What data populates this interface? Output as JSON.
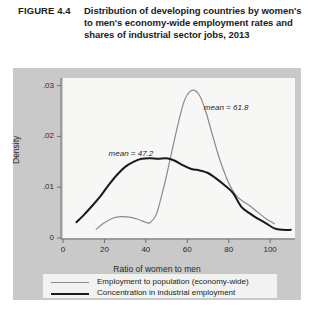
{
  "caption": {
    "label": "FIGURE 4.4",
    "text": "Distribution of developing countries by women's to men's economy-wide employment rates and shares of industrial sector jobs, 2013"
  },
  "colors": {
    "frame": "#c9c9c9",
    "panel": "#f7f7f5",
    "series_gray": "#8a8a8a",
    "series_black": "#1a1a1a",
    "axis": "#6f6f6f",
    "text": "#1b1b1b"
  },
  "chart_data": {
    "type": "line",
    "title": "Distribution of developing countries by women's to men's economy-wide employment rates and shares of industrial sector jobs, 2013",
    "xlabel": "Ratio of women to men",
    "ylabel": "Density",
    "xlim": [
      0,
      112
    ],
    "ylim": [
      0,
      0.0315
    ],
    "xticks": [
      "0",
      "20",
      "40",
      "60",
      "80",
      "100"
    ],
    "xtick_values": [
      0,
      20,
      40,
      60,
      80,
      100
    ],
    "yticks": [
      "0",
      ".01",
      ".02",
      ".03"
    ],
    "ytick_values": [
      0,
      0.01,
      0.02,
      0.03
    ],
    "grid": false,
    "legend_position": "bottom",
    "annotations": [
      {
        "text": "mean = 61.8",
        "x": 68,
        "y": 0.0255
      },
      {
        "text": "mean = 47.2",
        "x": 22,
        "y": 0.0165
      }
    ],
    "series": [
      {
        "name": "Employment to population (economy-wide)",
        "color": "#8a8a8a",
        "width": 1.2,
        "mean": 61.8,
        "x": [
          16,
          20,
          24,
          28,
          32,
          36,
          40,
          42,
          45,
          48,
          50,
          52,
          55,
          58,
          60,
          63,
          66,
          69,
          72,
          75,
          78,
          81,
          84,
          87,
          90,
          94,
          98,
          102
        ],
        "y": [
          0.0017,
          0.003,
          0.0039,
          0.0042,
          0.0041,
          0.0037,
          0.0031,
          0.003,
          0.0046,
          0.009,
          0.0123,
          0.016,
          0.0215,
          0.0263,
          0.0282,
          0.0291,
          0.028,
          0.0248,
          0.0205,
          0.0163,
          0.0128,
          0.01,
          0.0082,
          0.0072,
          0.0064,
          0.0051,
          0.0038,
          0.0028
        ]
      },
      {
        "name": "Concentration in industrial employment",
        "color": "#1a1a1a",
        "width": 2.0,
        "mean": 47.2,
        "x": [
          6.5,
          10,
          14,
          18,
          22,
          26,
          30,
          34,
          38,
          42,
          46,
          50,
          54,
          58,
          62,
          66,
          70,
          74,
          78,
          82,
          86,
          90,
          94,
          98,
          102,
          106,
          110
        ],
        "y": [
          0.0031,
          0.0045,
          0.0063,
          0.0082,
          0.0104,
          0.0124,
          0.014,
          0.015,
          0.0156,
          0.0157,
          0.0156,
          0.0157,
          0.0152,
          0.0143,
          0.0136,
          0.0133,
          0.0128,
          0.0117,
          0.0104,
          0.0089,
          0.0062,
          0.0049,
          0.0038,
          0.0029,
          0.0019,
          0.0016,
          0.0016
        ]
      }
    ]
  },
  "legend": {
    "items": [
      {
        "label": "Employment to population (economy-wide)",
        "color": "#8a8a8a",
        "width": 1.3
      },
      {
        "label": "Concentration in industrial employment",
        "color": "#1a1a1a",
        "width": 2.6
      }
    ]
  }
}
